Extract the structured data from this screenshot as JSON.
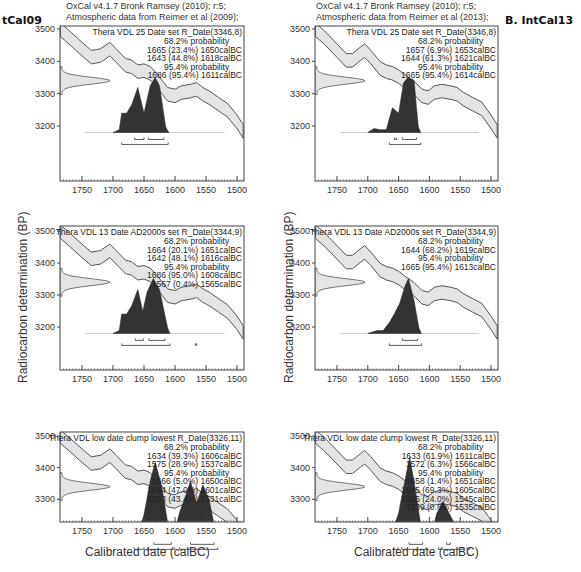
{
  "figure": {
    "left_header": {
      "line1": "OxCal v4.1.7 Bronk Ramsey (2010); r:5;",
      "line2": "Atmospheric data from Reimer et al (2009);"
    },
    "right_header": {
      "line1": "OxCal v4.1.7 Bronk Ramsey (2010); r:5;",
      "line2": "Atmospheric data from Reimer et al (2013);"
    },
    "left_panel_label": "tCal09",
    "right_panel_label": "B. IntCal13",
    "ylabel": "Radiocarbon determination (BP)",
    "xlabel": "Calibrated date (calBC)"
  },
  "chart_data": [
    {
      "type": "area",
      "panel": "IntCal09 - top",
      "title": "Thera VDL 25 Date set R_Date(3346,8)",
      "calibration": "IntCal09",
      "xlabel": "Calibrated date (calBC)",
      "ylabel": "Radiocarbon determination (BP)",
      "xlim": [
        1780,
        1490
      ],
      "ylim": [
        3120,
        3510
      ],
      "xticks": [
        1750,
        1700,
        1650,
        1600,
        1550,
        1500
      ],
      "yticks": [
        3500,
        3400,
        3300,
        3200
      ],
      "annotations": [
        "68.2% probability",
        "1665 (23.4%) 1650calBC",
        "1643 (44.8%) 1618calBC",
        "95.4% probability",
        "1686 (95.4%) 1611calBC"
      ],
      "ranges_68": [
        [
          1665,
          1650
        ],
        [
          1643,
          1618
        ]
      ],
      "ranges_95": [
        [
          1686,
          1611
        ]
      ],
      "posterior_peaks": [
        {
          "x": 1683,
          "h": 0.35
        },
        {
          "x": 1660,
          "h": 0.75
        },
        {
          "x": 1648,
          "h": 0.3
        },
        {
          "x": 1633,
          "h": 1.0
        },
        {
          "x": 1620,
          "h": 0.2
        }
      ]
    },
    {
      "type": "area",
      "panel": "IntCal09 - middle",
      "title": "Thera VDL 13 Date AD2000s set R_Date(3344,9)",
      "calibration": "IntCal09",
      "xlim": [
        1780,
        1490
      ],
      "ylim": [
        3120,
        3510
      ],
      "xticks": [
        1750,
        1700,
        1650,
        1600,
        1550,
        1500
      ],
      "yticks": [
        3500,
        3400,
        3300,
        3200
      ],
      "annotations": [
        "68.2% probability",
        "1664 (20.1%) 1651calBC",
        "1642 (48.1%) 1616calBC",
        "95.4% probability",
        "1686 (95.0%) 1608calBC",
        "1567 (0.4%) 1565calBC"
      ],
      "ranges_68": [
        [
          1664,
          1651
        ],
        [
          1642,
          1616
        ]
      ],
      "ranges_95": [
        [
          1686,
          1608
        ],
        [
          1567,
          1565
        ]
      ]
    },
    {
      "type": "area",
      "panel": "IntCal09 - bottom",
      "title": "Thera VDL low date clump lowest R_Date(3326,11)",
      "calibration": "IntCal09",
      "xlim": [
        1780,
        1490
      ],
      "ylim": [
        3120,
        3510
      ],
      "xticks": [
        1750,
        1700,
        1650,
        1600,
        1550,
        1500
      ],
      "yticks": [
        3500,
        3400,
        3300,
        3200
      ],
      "annotations": [
        "68.2% probability",
        "1634 (39.3%) 1606calBC",
        "1575 (28.9%) 1537calBC",
        "95.4% probability",
        "1666 (5.0%) 1650calBC",
        "1644 (47.0%) 1601calBC",
        "1593 (43.4%) 1531calBC"
      ],
      "ranges_68": [
        [
          1634,
          1606
        ],
        [
          1575,
          1537
        ]
      ],
      "ranges_95": [
        [
          1666,
          1650
        ],
        [
          1644,
          1601
        ],
        [
          1593,
          1531
        ]
      ]
    },
    {
      "type": "area",
      "panel": "IntCal13 - top",
      "title": "Thera VDL 25 Date set R_Date(3346,8)",
      "calibration": "IntCal13",
      "xlim": [
        1780,
        1490
      ],
      "ylim": [
        3120,
        3510
      ],
      "xticks": [
        1750,
        1700,
        1650,
        1600,
        1550,
        1500
      ],
      "yticks": [
        3500,
        3400,
        3300,
        3200
      ],
      "annotations": [
        "68.2% probability",
        "1657 (6.9%) 1653calBC",
        "1644 (61.3%) 1621calBC",
        "95.4% probability",
        "1665 (95.4%) 1614calBC"
      ],
      "ranges_68": [
        [
          1657,
          1653
        ],
        [
          1644,
          1621
        ]
      ],
      "ranges_95": [
        [
          1665,
          1614
        ]
      ]
    },
    {
      "type": "area",
      "panel": "IntCal13 - middle",
      "title": "Thera VDL 13 Date AD2000s set R_Date(3344,9)",
      "calibration": "IntCal13",
      "xlim": [
        1780,
        1490
      ],
      "ylim": [
        3120,
        3510
      ],
      "xticks": [
        1750,
        1700,
        1650,
        1600,
        1550,
        1500
      ],
      "yticks": [
        3500,
        3400,
        3300,
        3200
      ],
      "annotations": [
        "68.2% probability",
        "1644 (68.2%) 1619calBC",
        "95.4% probability",
        "1665 (95.4%) 1613calBC"
      ],
      "ranges_68": [
        [
          1644,
          1619
        ]
      ],
      "ranges_95": [
        [
          1665,
          1613
        ]
      ]
    },
    {
      "type": "area",
      "panel": "IntCal13 - bottom",
      "title": "Thera VDL low date clump lowest R_Date(3326,11)",
      "calibration": "IntCal13",
      "xlim": [
        1780,
        1490
      ],
      "ylim": [
        3120,
        3510
      ],
      "xticks": [
        1750,
        1700,
        1650,
        1600,
        1550,
        1500
      ],
      "yticks": [
        3500,
        3400,
        3300,
        3200
      ],
      "annotations": [
        "68.2% probability",
        "1633 (61.9%) 1611calBC",
        "1572 (6.3%) 1566calBC",
        "95.4% probability",
        "1658 (1.4%) 1651calBC",
        "1645 (69.3%) 1605calBC",
        "1585 (24.0%) 1545calBC",
        "1539 (0.6%) 1535calBC"
      ],
      "ranges_68": [
        [
          1633,
          1611
        ],
        [
          1572,
          1566
        ]
      ],
      "ranges_95": [
        [
          1658,
          1651
        ],
        [
          1645,
          1605
        ],
        [
          1585,
          1545
        ],
        [
          1539,
          1535
        ]
      ]
    }
  ]
}
